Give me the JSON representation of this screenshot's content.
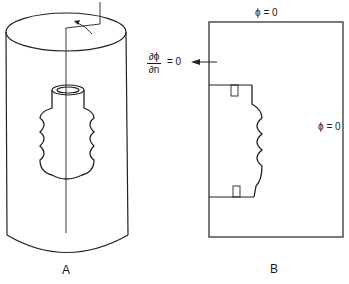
{
  "figure": {
    "panel_a": {
      "label": "A",
      "description": "cylinder containing corrugated bellows-shaped body with rotation axis"
    },
    "panel_b": {
      "label": "B",
      "description": "2D meridional cross-section with boundary conditions",
      "top_bc": "ϕ = 0",
      "right_bc": "ϕ = 0",
      "left_bc_numerator": "∂ϕ",
      "left_bc_denominator": "∂n",
      "left_bc_rhs": "= 0"
    }
  },
  "colors": {
    "line": "#222222",
    "background": "#ffffff"
  }
}
